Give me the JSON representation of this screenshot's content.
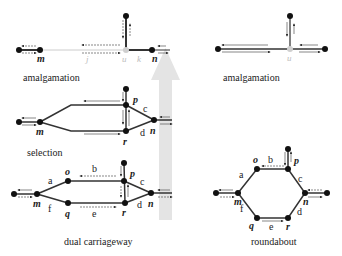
{
  "colors": {
    "road": "#333333",
    "road_light": "#c8c8c8",
    "node": "#111111",
    "node_ghost": "#cfcfcf",
    "arrow_big": "#e4e4e4",
    "flow_arrow": "#444444"
  },
  "panels": {
    "amalgamation_left": {
      "caption": "amalgamation",
      "nodes": {
        "m": "m",
        "n": "n",
        "u": "u"
      },
      "links": {
        "j": "j",
        "k": "k"
      }
    },
    "amalgamation_right": {
      "caption": "amalgamation",
      "nodes": {
        "u": "u"
      }
    },
    "selection": {
      "caption": "selection",
      "nodes": {
        "m": "m",
        "n": "n",
        "p": "p",
        "r": "r"
      },
      "links": {
        "c": "c",
        "d": "d"
      }
    },
    "dual_carriageway": {
      "caption": "dual carriageway",
      "nodes": {
        "m": "m",
        "n": "n",
        "o": "o",
        "p": "p",
        "q": "q",
        "r": "r"
      },
      "links": {
        "a": "a",
        "b": "b",
        "c": "c",
        "d": "d",
        "e": "e",
        "f": "f"
      }
    },
    "roundabout": {
      "caption": "roundabout",
      "nodes": {
        "m": "m",
        "n": "n",
        "o": "o",
        "p": "p",
        "q": "q",
        "r": "r"
      },
      "links": {
        "a": "a",
        "b": "b",
        "c": "c",
        "d": "d",
        "e": "e",
        "f": "f"
      }
    }
  }
}
